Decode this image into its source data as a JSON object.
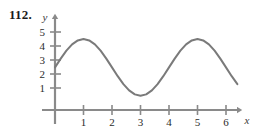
{
  "figure": {
    "problem_number": "112.",
    "background_color": "#ffffff",
    "curve_color": "#7a7a7a",
    "axis_color": "#8a8a8a",
    "text_color": "#1a1a1a"
  },
  "chart_data": {
    "type": "line",
    "title": "",
    "subtitle": "",
    "xlabel": "x",
    "ylabel": "y",
    "xlim": [
      0,
      6.4
    ],
    "ylim": [
      0,
      5.6
    ],
    "xticks": [
      1,
      2,
      3,
      4,
      5,
      6
    ],
    "xtick_labels": [
      "1",
      "2",
      "3",
      "4",
      "5",
      "6"
    ],
    "yticks": [
      1,
      2,
      3,
      4,
      5
    ],
    "ytick_labels": [
      "1",
      "2",
      "3",
      "4",
      "5"
    ],
    "grid": false,
    "legend": false,
    "legend_position": "none",
    "annotations": [],
    "series": [
      {
        "name": "curve",
        "description": "sinusoid with amplitude 2, midline 3, period 4, maximum at x=1",
        "equation": "y = 3 + 2 sin(pi (x - 0.5) / 2)",
        "x": [
          0,
          0.2,
          0.4,
          0.6,
          0.8,
          1,
          1.2,
          1.4,
          1.6,
          1.8,
          2,
          2.2,
          2.4,
          2.6,
          2.8,
          3,
          3.2,
          3.4,
          3.6,
          3.8,
          4,
          4.2,
          4.4,
          4.6,
          4.8,
          5,
          5.2,
          5.4,
          5.6,
          5.8,
          6,
          6.2,
          6.4
        ],
        "y": [
          3,
          3.62,
          4.18,
          4.62,
          4.9,
          5,
          4.9,
          4.62,
          4.18,
          3.62,
          3,
          2.38,
          1.82,
          1.38,
          1.1,
          1,
          1.1,
          1.38,
          1.82,
          2.38,
          3,
          3.62,
          4.18,
          4.62,
          4.9,
          5,
          4.9,
          4.62,
          4.18,
          3.62,
          3,
          2.38,
          1.82
        ],
        "key_points": {
          "start": [
            0,
            3
          ],
          "first_maximum": [
            1,
            5
          ],
          "minimum": [
            3,
            1
          ],
          "second_maximum": [
            5,
            5
          ],
          "end": [
            6.4,
            1.82
          ]
        }
      }
    ]
  }
}
